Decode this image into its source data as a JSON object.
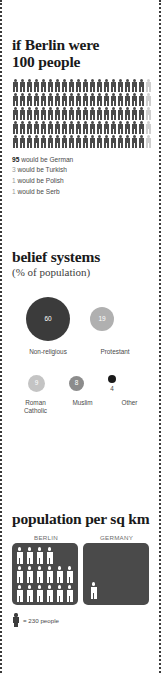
{
  "people_section": {
    "title_line1": "if Berlin were",
    "title_line2": "100 people",
    "grid": {
      "total": 100,
      "columns": 20,
      "rows": 5,
      "dark_count": 95,
      "light_count": 5,
      "dark_color": "#4a4a4a",
      "light_color": "#cfcfcf",
      "icon": "person-icon"
    },
    "legend": [
      {
        "value": "95",
        "text": " would be German",
        "emphasis": true
      },
      {
        "value": "3",
        "text": " would be Turkish",
        "emphasis": false
      },
      {
        "value": "1",
        "text": " would be Polish",
        "emphasis": false
      },
      {
        "value": "1",
        "text": " would be Serb",
        "emphasis": false
      }
    ]
  },
  "belief_section": {
    "title": "belief systems",
    "subtitle": "(% of population)",
    "bubbles_row1": [
      {
        "label": "Non-religious",
        "value": "60",
        "size": 44,
        "color": "#3b3b3b",
        "inside": true
      },
      {
        "label": "Protestant",
        "value": "19",
        "size": 24,
        "color": "#b0b0b0",
        "inside": true
      }
    ],
    "bubbles_row2": [
      {
        "label_line1": "Roman",
        "label_line2": "Catholic",
        "value": "9",
        "size": 17,
        "color": "#c4c4c4",
        "inside": true
      },
      {
        "label_line1": "Muslim",
        "label_line2": "",
        "value": "8",
        "size": 15,
        "color": "#8c8c8c",
        "inside": true
      },
      {
        "label_line1": "Other",
        "label_line2": "",
        "value": "4",
        "size": 8,
        "color": "#1a1a1a",
        "inside": false
      }
    ]
  },
  "population_section": {
    "title": "population per sq km",
    "panels": [
      {
        "name": "BERLIN",
        "figure_count": 16,
        "rows": [
          4,
          6,
          6
        ]
      },
      {
        "name": "GERMANY",
        "figure_count": 1,
        "rows": [
          1
        ]
      }
    ],
    "key": {
      "symbol": "person-icon",
      "text": "= 230 people"
    }
  },
  "chart_data": {
    "type": "pictogram",
    "charts": [
      {
        "type": "pictogram",
        "title": "if Berlin were 100 people",
        "unit": "1 icon = 1 person",
        "categories": [
          "German",
          "Turkish",
          "Polish",
          "Serb"
        ],
        "values": [
          95,
          3,
          1,
          1
        ],
        "total": 100
      },
      {
        "type": "bubble",
        "title": "belief systems",
        "ylabel": "% of population",
        "categories": [
          "Non-religious",
          "Protestant",
          "Roman Catholic",
          "Muslim",
          "Other"
        ],
        "values": [
          60,
          19,
          9,
          8,
          4
        ]
      },
      {
        "type": "pictogram",
        "title": "population per sq km",
        "unit": "1 icon = 230 people",
        "categories": [
          "BERLIN",
          "GERMANY"
        ],
        "values": [
          16,
          1
        ],
        "icon_value": 230
      }
    ]
  }
}
